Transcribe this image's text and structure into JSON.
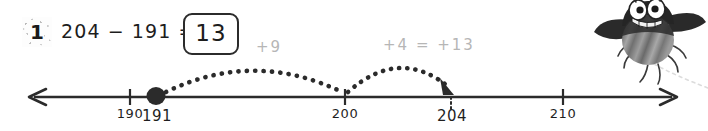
{
  "problem": {
    "number": "1",
    "equation": "204 − 191 =",
    "answer": "13"
  },
  "jumps": [
    {
      "label": "+9",
      "from": "191",
      "to": "200",
      "amount": 9
    },
    {
      "label": "+4  =  +13",
      "from": "200",
      "to": "204",
      "amount": 4
    }
  ],
  "numberline": {
    "start_marker": "191",
    "end_marker": "204",
    "ticks": [
      {
        "label": "190",
        "style": "printed"
      },
      {
        "label": "191",
        "style": "handwritten"
      },
      {
        "label": "200",
        "style": "printed"
      },
      {
        "label": "204",
        "style": "handwritten"
      },
      {
        "label": "210",
        "style": "printed"
      }
    ],
    "left_arrow": "arrow-left",
    "right_arrow": "arrow-right"
  },
  "character": {
    "name": "cartoon-bug",
    "description": "striped flying bug mascot"
  },
  "colors": {
    "ink": "#1d1d1d",
    "line": "#2b2b2b",
    "faint": "#b6b6b6",
    "background": "#ffffff"
  }
}
